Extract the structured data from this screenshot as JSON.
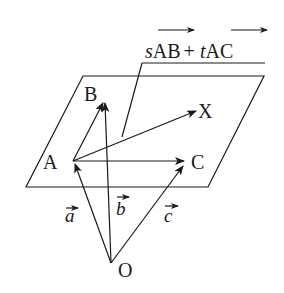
{
  "diagram": {
    "type": "vector-plane",
    "plane": {
      "shape": "parallelogram",
      "corners": [
        [
          83,
          76
        ],
        [
          264,
          76
        ],
        [
          208,
          187
        ],
        [
          26,
          187
        ]
      ]
    },
    "points": {
      "A": {
        "label": "A",
        "pos": [
          73,
          161
        ]
      },
      "B": {
        "label": "B",
        "pos": [
          104,
          102
        ]
      },
      "C": {
        "label": "C",
        "pos": [
          185,
          161
        ]
      },
      "X": {
        "label": "X",
        "pos": [
          197,
          111
        ]
      },
      "O": {
        "label": "O",
        "pos": [
          111,
          263
        ]
      }
    },
    "vectors": [
      {
        "from": "O",
        "to": "A",
        "label": "a"
      },
      {
        "from": "O",
        "to": "B",
        "label": "b"
      },
      {
        "from": "O",
        "to": "C",
        "label": "c"
      },
      {
        "from": "A",
        "to": "B",
        "label": ""
      },
      {
        "from": "A",
        "to": "C",
        "label": ""
      },
      {
        "from": "A",
        "to": "X",
        "label": ""
      }
    ],
    "vector_labels": {
      "a": "a",
      "b": "b",
      "c": "c"
    },
    "annotation": {
      "s": "s",
      "ab": "AB",
      "plus": "+",
      "t": "t",
      "ac": "AC",
      "full_text": "sAB + tAC"
    }
  }
}
